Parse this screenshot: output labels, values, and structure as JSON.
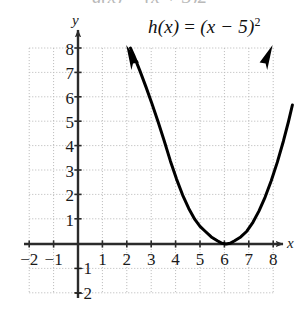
{
  "figure": {
    "width": 306,
    "height": 311,
    "background_color": "#ffffff",
    "clipped_artifact_text": "g(x) = (x + 3)2"
  },
  "equation": {
    "prefix": "h(x) ",
    "equals": "= ",
    "body": "(x − 5)",
    "exponent": "2",
    "full": "h(x) = (x − 5)²"
  },
  "axes": {
    "x_name": "x",
    "y_name": "y",
    "axis_color": "#2b2b2b",
    "grid_color": "#bdbdbd",
    "origin_px": {
      "x": 78,
      "y": 244
    },
    "unit_px": 24.4,
    "x_ticks": [
      "−2",
      "−1",
      "1",
      "2",
      "3",
      "4",
      "5",
      "6",
      "7",
      "8"
    ],
    "x_tick_values": [
      -2,
      -1,
      1,
      2,
      3,
      4,
      5,
      6,
      7,
      8
    ],
    "y_ticks": [
      "−2",
      "−1",
      "1",
      "2",
      "3",
      "4",
      "5",
      "6",
      "7",
      "8"
    ],
    "y_tick_values": [
      -2,
      -1,
      1,
      2,
      3,
      4,
      5,
      6,
      7,
      8
    ]
  },
  "chart_data": {
    "type": "line",
    "xlabel": "x",
    "ylabel": "y",
    "xlim": [
      -2,
      8
    ],
    "ylim": [
      -2,
      8
    ],
    "grid": true,
    "grid_step": 1,
    "legend": "none",
    "curve_color": "#000000",
    "curve_width_px": 3,
    "arrowheads": [
      "start",
      "end"
    ],
    "annotations": [
      {
        "text": "h(x) = (x − 5)²",
        "x": 4.6,
        "y": 9.1
      }
    ],
    "series": [
      {
        "name": "h(x) = (x − 5)²",
        "formula": "(x - 5)^2",
        "vertex": [
          5,
          0
        ],
        "x": [
          2.0,
          2.25,
          2.5,
          2.75,
          3.0,
          3.25,
          3.5,
          3.75,
          4.0,
          4.25,
          4.5,
          4.75,
          5.0,
          5.25,
          5.5,
          5.75,
          6.0,
          6.25,
          6.5,
          6.75,
          7.0,
          7.25,
          7.5,
          7.75,
          8.0
        ],
        "values": [
          9.0,
          7.5625,
          6.25,
          5.0625,
          4.0,
          3.0625,
          2.25,
          1.5625,
          1.0,
          0.5625,
          0.25,
          0.0625,
          0.0,
          0.0625,
          0.25,
          0.5625,
          1.0,
          1.5625,
          2.25,
          3.0625,
          4.0,
          5.0625,
          6.25,
          7.5625,
          9.0
        ]
      }
    ],
    "key_points": [
      {
        "label": "vertex",
        "x": 5,
        "y": 0
      },
      {
        "label": "left branch end",
        "x": 2.15,
        "y": 8
      },
      {
        "label": "right branch end",
        "x": 7.85,
        "y": 8
      }
    ]
  }
}
